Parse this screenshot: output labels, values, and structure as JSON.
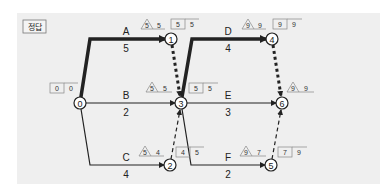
{
  "badge": {
    "label": "정답"
  },
  "colors": {
    "panel_bg": "#efefef",
    "line": "#222222",
    "box_stroke": "#888888"
  },
  "nodes": [
    {
      "id": "0",
      "x": 80,
      "y": 103
    },
    {
      "id": "1",
      "x": 171,
      "y": 39
    },
    {
      "id": "2",
      "x": 170,
      "y": 165
    },
    {
      "id": "3",
      "x": 181,
      "y": 103
    },
    {
      "id": "4",
      "x": 272,
      "y": 39
    },
    {
      "id": "5",
      "x": 271,
      "y": 165
    },
    {
      "id": "6",
      "x": 282,
      "y": 103
    }
  ],
  "activities": [
    {
      "name": "A",
      "duration": "5",
      "from": "0",
      "to": "1",
      "critical": true
    },
    {
      "name": "B",
      "duration": "2",
      "from": "0",
      "to": "3",
      "critical": false
    },
    {
      "name": "C",
      "duration": "4",
      "from": "0",
      "to": "2",
      "critical": false
    },
    {
      "name": "D",
      "duration": "4",
      "from": "3",
      "to": "4",
      "critical": true
    },
    {
      "name": "E",
      "duration": "3",
      "from": "3",
      "to": "6",
      "critical": false
    },
    {
      "name": "F",
      "duration": "2",
      "from": "3",
      "to": "5",
      "critical": false
    }
  ],
  "dummies": [
    {
      "from": "1",
      "to": "3",
      "critical": true
    },
    {
      "from": "2",
      "to": "3",
      "critical": false
    },
    {
      "from": "4",
      "to": "6",
      "critical": true
    },
    {
      "from": "5",
      "to": "6",
      "critical": false
    }
  ],
  "annotations": {
    "n0": {
      "box": [
        "0",
        "0"
      ]
    },
    "n1": {
      "tri": "5",
      "tri_val": "5",
      "box": [
        "5",
        "5"
      ]
    },
    "n3": {
      "tri": "5",
      "tri_val": "5",
      "box": [
        "5",
        "5"
      ]
    },
    "n2": {
      "tri": "5",
      "tri_val": "4",
      "box": [
        "4",
        "5"
      ]
    },
    "n4": {
      "tri": "9",
      "tri_val": "9",
      "box": [
        "9",
        "9"
      ]
    },
    "n6": {
      "tri": "9",
      "tri_val": "9"
    },
    "n5": {
      "tri": "9",
      "tri_val": "7",
      "box": [
        "7",
        "9"
      ]
    }
  }
}
